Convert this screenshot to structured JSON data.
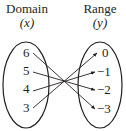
{
  "domain_header": {
    "title": "Domain",
    "var": "(x)"
  },
  "range_header": {
    "title": "Range",
    "var": "(y)"
  },
  "domain_values": [
    "6",
    "5",
    "4",
    "3"
  ],
  "range_values": [
    "0",
    "−1",
    "−2",
    "−3"
  ],
  "mapping": [
    {
      "from": "6",
      "to": "−3"
    },
    {
      "from": "5",
      "to": "−2"
    },
    {
      "from": "4",
      "to": "−1"
    },
    {
      "from": "3",
      "to": "0"
    }
  ],
  "colors": {
    "ink": "#231f20",
    "background": "#ffffff"
  }
}
